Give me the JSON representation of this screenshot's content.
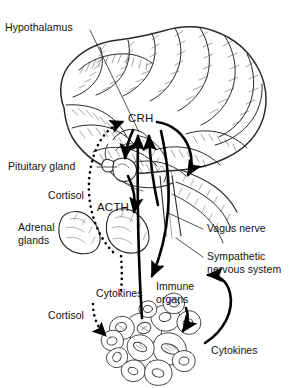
{
  "figure": {
    "background_color": "#ffffff",
    "line_color": "#000000",
    "text_color": "#111111",
    "width": 299,
    "height": 388
  },
  "labels": {
    "hypothalamus": "Hypothalamus",
    "crh": "CRH",
    "pituitary_gland": "Pituitary gland",
    "cortisol_upper": "Cortisol",
    "acth": "ACTH",
    "adrenal_glands_line1": "Adrenal",
    "adrenal_glands_line2": "glands",
    "vagus_nerve": "Vagus nerve",
    "sympathetic_line1": "Sympathetic",
    "sympathetic_line2": "nervous system",
    "cytokines_left": "Cytokines",
    "immune_organs_line1": "Immune",
    "immune_organs_line2": "organs",
    "cortisol_lower": "Cortisol",
    "cytokines_right": "Cytokines"
  },
  "anatomy": {
    "brain": "brain-lateral-view-illustration",
    "pituitary": "pituitary-gland-illustration",
    "adrenal_left": "adrenal-gland-left-illustration",
    "adrenal_right": "adrenal-gland-right-illustration",
    "immune_cells": "immune-cell-cluster-illustration"
  },
  "pathways": [
    {
      "name": "cortisol-negative-feedback-to-hypothalamus",
      "style": "dotted",
      "from": "adrenal glands",
      "to": "CRH",
      "label": "Cortisol"
    },
    {
      "name": "crh-to-pituitary",
      "style": "solid",
      "from": "CRH",
      "to": "Pituitary gland"
    },
    {
      "name": "acth-to-adrenal",
      "style": "solid",
      "from": "Pituitary gland",
      "to": "Adrenal glands",
      "label": "ACTH"
    },
    {
      "name": "cytokines-to-crh",
      "style": "solid",
      "from": "Immune organs",
      "to": "CRH",
      "label": "Cytokines"
    },
    {
      "name": "vagus-nerve-to-crh",
      "style": "solid",
      "from": "Vagus nerve",
      "to": "CRH"
    },
    {
      "name": "sympathetic-nervous-system-to-immune-organs",
      "style": "solid",
      "from": "CRH",
      "to": "Immune organs"
    },
    {
      "name": "cortisol-to-immune-cells",
      "style": "dotted",
      "from": "Adrenal glands",
      "to": "Immune cells",
      "label": "Cortisol"
    },
    {
      "name": "cytokines-from-immune-cells",
      "style": "solid",
      "from": "Immune cells",
      "to": "Sympathetic nervous system",
      "label": "Cytokines"
    }
  ]
}
